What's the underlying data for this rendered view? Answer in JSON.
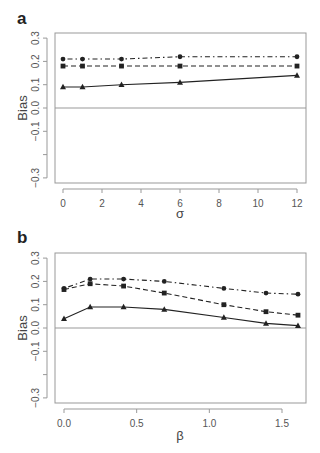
{
  "chart_data": [
    {
      "panel": "a",
      "type": "line",
      "title": "",
      "xlabel": "σ",
      "ylabel": "Bias",
      "xlim": [
        -0.4,
        12.4
      ],
      "ylim": [
        -0.32,
        0.32
      ],
      "xticks": [
        0,
        2,
        4,
        6,
        8,
        10,
        12
      ],
      "xtick_labels": [
        "0",
        "2",
        "4",
        "6",
        "8",
        "10",
        "12"
      ],
      "yticks": [
        0.3,
        0.2,
        0.1,
        0.0,
        -0.1,
        -0.2,
        -0.3
      ],
      "ytick_labels": [
        "0.3",
        "0.2",
        "0.1",
        "0.0",
        "−0.1",
        "",
        "−0.3"
      ],
      "hline": 0.0,
      "grid": false,
      "x": [
        0,
        1,
        3,
        6,
        12
      ],
      "series": [
        {
          "name": "circle-dotdash",
          "marker": "circle",
          "linestyle": "dotdash",
          "values": [
            0.21,
            0.21,
            0.21,
            0.22,
            0.22
          ]
        },
        {
          "name": "square-dashed",
          "marker": "square",
          "linestyle": "dashed",
          "values": [
            0.18,
            0.18,
            0.18,
            0.18,
            0.18
          ]
        },
        {
          "name": "triangle-solid",
          "marker": "triangle",
          "linestyle": "solid",
          "values": [
            0.09,
            0.09,
            0.1,
            0.11,
            0.14
          ]
        }
      ]
    },
    {
      "panel": "b",
      "type": "line",
      "title": "",
      "xlabel": "β",
      "ylabel": "Bias",
      "xlim": [
        -0.04,
        1.66
      ],
      "ylim": [
        -0.32,
        0.32
      ],
      "xticks": [
        0.0,
        0.5,
        1.0,
        1.5
      ],
      "xtick_labels": [
        "0.0",
        "0.5",
        "1.0",
        "1.5"
      ],
      "yticks": [
        0.3,
        0.2,
        0.1,
        0.0,
        -0.1,
        -0.2,
        -0.3
      ],
      "ytick_labels": [
        "0.3",
        "0.2",
        "0.1",
        "0.0",
        "−0.1",
        "",
        "−0.3"
      ],
      "hline": 0.0,
      "grid": false,
      "x": [
        0.0,
        0.18,
        0.41,
        0.69,
        1.1,
        1.39,
        1.61
      ],
      "series": [
        {
          "name": "circle-dotdash",
          "marker": "circle",
          "linestyle": "dotdash",
          "values": [
            0.17,
            0.21,
            0.21,
            0.2,
            0.17,
            0.15,
            0.145
          ]
        },
        {
          "name": "square-dashed",
          "marker": "square",
          "linestyle": "dashed",
          "values": [
            0.165,
            0.19,
            0.18,
            0.15,
            0.1,
            0.07,
            0.055
          ]
        },
        {
          "name": "triangle-solid",
          "marker": "triangle",
          "linestyle": "solid",
          "values": [
            0.04,
            0.09,
            0.09,
            0.08,
            0.045,
            0.02,
            0.01
          ]
        }
      ]
    }
  ],
  "panels": {
    "a": {
      "label": "a",
      "xlabel": "σ",
      "ylabel": "Bias"
    },
    "b": {
      "label": "b",
      "xlabel": "β",
      "ylabel": "Bias"
    }
  },
  "colors": {
    "line": "#222222",
    "axis": "#999999",
    "text": "#555555"
  }
}
